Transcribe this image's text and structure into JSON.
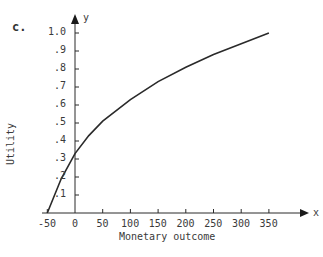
{
  "panel_label": "c.",
  "chart_data": {
    "type": "line",
    "title": "",
    "xlabel": "Monetary outcome",
    "ylabel": "Utility",
    "x_axis_symbol": "x",
    "y_axis_symbol": "y",
    "xlim": [
      -50,
      350
    ],
    "ylim": [
      0,
      1.0
    ],
    "x_ticks": [
      "-50",
      "0",
      "50",
      "100",
      "150",
      "200",
      "250",
      "300",
      "350"
    ],
    "y_ticks": [
      ".1",
      ".2",
      ".3",
      ".4",
      ".5",
      ".6",
      ".7",
      ".8",
      ".9",
      "1.0"
    ],
    "grid": false,
    "series": [
      {
        "name": "Utility curve",
        "x": [
          -50,
          -25,
          0,
          25,
          50,
          100,
          150,
          200,
          250,
          300,
          350
        ],
        "y": [
          0.0,
          0.19,
          0.33,
          0.43,
          0.51,
          0.63,
          0.73,
          0.81,
          0.88,
          0.94,
          1.0
        ]
      }
    ]
  }
}
